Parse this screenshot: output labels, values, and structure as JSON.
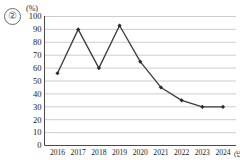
{
  "item_number": "②",
  "chart_data": {
    "type": "line",
    "title": "",
    "subtitle": "",
    "xlabel": "(년)",
    "ylabel": "(%)",
    "unit_label": "(%)",
    "x_unit_label": "(년)",
    "categories": [
      "2016",
      "2017",
      "2018",
      "2019",
      "2020",
      "2021",
      "2022",
      "2023",
      "2024"
    ],
    "values": [
      56,
      90,
      60,
      93,
      65,
      45,
      35,
      30,
      30
    ],
    "series": [
      {
        "name": "",
        "values": [
          56,
          90,
          60,
          93,
          65,
          45,
          35,
          30,
          30
        ]
      }
    ],
    "ylim": [
      0,
      100
    ],
    "yticks": [
      0,
      10,
      20,
      30,
      40,
      50,
      60,
      70,
      80,
      90,
      100
    ],
    "ytick_labels": [
      "0",
      "10",
      "20",
      "30",
      "40",
      "50",
      "60",
      "70",
      "80",
      "90",
      "100"
    ],
    "grid": true,
    "grid_axis": "y",
    "legend": "none",
    "marker": "diamond",
    "line_color": "#3b3b3b",
    "marker_color": "#2b2b2b",
    "grid_color": "#b8b8b8",
    "axis_color": "#4a4a4a"
  }
}
